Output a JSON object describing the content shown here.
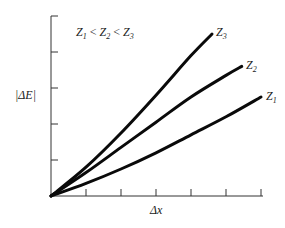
{
  "chart_data": {
    "type": "line",
    "title": "",
    "xlabel": "Δx",
    "ylabel": "|ΔE|",
    "annotation": "Z1 < Z2 < Z3",
    "xlim": [
      0,
      6
    ],
    "ylim": [
      0,
      5
    ],
    "x_ticks": [
      1,
      2,
      3,
      4,
      5,
      6
    ],
    "y_ticks": [
      1,
      2,
      3,
      4,
      5
    ],
    "tick_labels_shown": false,
    "grid": false,
    "legend": "inline labels at curve ends",
    "series": [
      {
        "name": "Z3",
        "label": "Z",
        "subscript": "3",
        "x": [
          0,
          1,
          2,
          3,
          4,
          4.6
        ],
        "y": [
          0,
          0.8,
          1.75,
          2.8,
          3.9,
          4.5
        ]
      },
      {
        "name": "Z2",
        "label": "Z",
        "subscript": "2",
        "x": [
          0,
          1,
          2,
          3,
          4,
          5,
          5.45
        ],
        "y": [
          0,
          0.65,
          1.35,
          2.05,
          2.75,
          3.35,
          3.6
        ]
      },
      {
        "name": "Z1",
        "label": "Z",
        "subscript": "1",
        "x": [
          0,
          1,
          2,
          3,
          4,
          5,
          6
        ],
        "y": [
          0,
          0.35,
          0.75,
          1.2,
          1.7,
          2.2,
          2.75
        ]
      }
    ]
  },
  "labels": {
    "annotation_z1": "Z",
    "annotation_s1": "1",
    "annotation_z2": "Z",
    "annotation_s2": "2",
    "annotation_z3": "Z",
    "annotation_s3": "3",
    "lt": "<",
    "ylabel": "|ΔE|",
    "xlabel": "Δx",
    "z3": "Z",
    "z3_sub": "3",
    "z2": "Z",
    "z2_sub": "2",
    "z1": "Z",
    "z1_sub": "1"
  }
}
